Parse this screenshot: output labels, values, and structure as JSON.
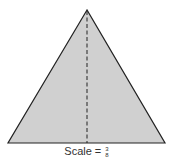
{
  "diagram": {
    "shape": "isosceles-triangle",
    "fill_color": "#d0d0d0",
    "stroke_color": "#222222",
    "apex": [
      87,
      10
    ],
    "base_left": [
      8,
      143
    ],
    "base_right": [
      165,
      143
    ],
    "altitude": {
      "style": "dashed",
      "from": [
        87,
        10
      ],
      "to": [
        87,
        143
      ]
    }
  },
  "caption": {
    "label": "Scale =",
    "numerator": "3",
    "denominator": "8"
  }
}
